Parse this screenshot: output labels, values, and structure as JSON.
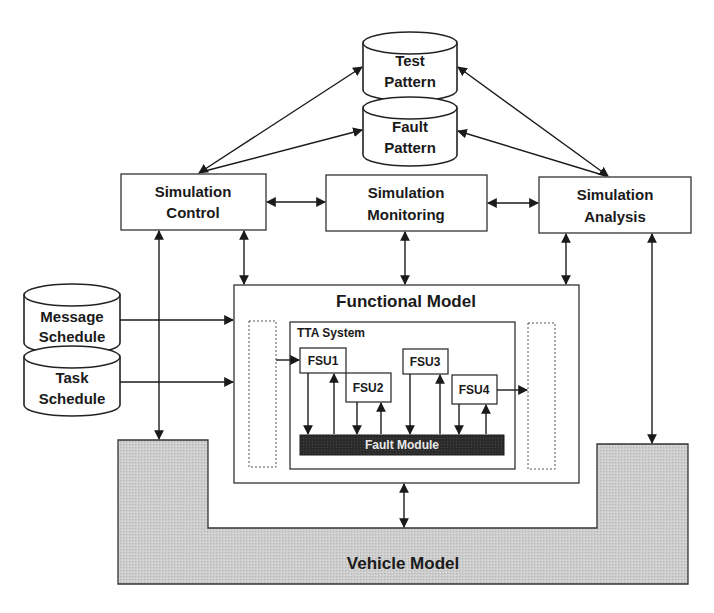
{
  "diagram": {
    "databases": {
      "test_pattern": [
        "Test",
        "Pattern"
      ],
      "fault_pattern": [
        "Fault",
        "Pattern"
      ],
      "message_schedule": [
        "Message",
        "Schedule"
      ],
      "task_schedule": [
        "Task",
        "Schedule"
      ]
    },
    "simulation_control": [
      "Simulation",
      "Control"
    ],
    "simulation_monitoring": [
      "Simulation",
      "Monitoring"
    ],
    "simulation_analysis": [
      "Simulation",
      "Analysis"
    ],
    "functional_model": "Functional Model",
    "tta_system": "TTA System",
    "fsus": [
      "FSU1",
      "FSU2",
      "FSU3",
      "FSU4"
    ],
    "fault_module": "Fault Module",
    "vehicle_model": "Vehicle Model",
    "colors": {
      "vehicle_fill": "#cfcfcf",
      "fault_module_fill": "#2b2b2b",
      "stroke": "#1a1a1a"
    }
  }
}
